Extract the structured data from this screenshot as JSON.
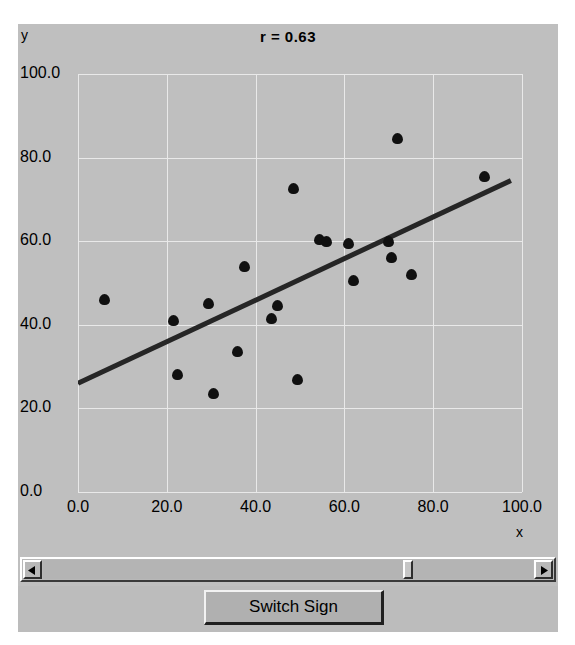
{
  "window": {
    "background_color": "#bfbfbf"
  },
  "chart_data": {
    "type": "scatter",
    "title": "r = 0.63",
    "xlabel": "x",
    "ylabel": "y",
    "xlim": [
      0.0,
      100.0
    ],
    "ylim": [
      0.0,
      100.0
    ],
    "xticks": [
      "0.0",
      "20.0",
      "40.0",
      "60.0",
      "80.0",
      "100.0"
    ],
    "xtick_values": [
      0,
      20,
      40,
      60,
      80,
      100
    ],
    "yticks": [
      "0.0",
      "20.0",
      "40.0",
      "60.0",
      "80.0",
      "100.0"
    ],
    "ytick_values": [
      0,
      20,
      40,
      60,
      80,
      100
    ],
    "grid": true,
    "legend": "none",
    "point_color": "#101010",
    "line_color": "#262626",
    "points": [
      {
        "x": 6.0,
        "y": 46.0
      },
      {
        "x": 21.5,
        "y": 41.0
      },
      {
        "x": 22.5,
        "y": 28.0
      },
      {
        "x": 29.5,
        "y": 45.0
      },
      {
        "x": 30.5,
        "y": 23.5
      },
      {
        "x": 36.0,
        "y": 33.5
      },
      {
        "x": 37.5,
        "y": 54.0
      },
      {
        "x": 43.5,
        "y": 41.5
      },
      {
        "x": 45.0,
        "y": 44.5
      },
      {
        "x": 48.5,
        "y": 72.5
      },
      {
        "x": 49.5,
        "y": 27.0
      },
      {
        "x": 54.5,
        "y": 60.5
      },
      {
        "x": 56.0,
        "y": 60.0
      },
      {
        "x": 61.0,
        "y": 59.5
      },
      {
        "x": 62.0,
        "y": 50.5
      },
      {
        "x": 70.0,
        "y": 60.0
      },
      {
        "x": 70.5,
        "y": 56.0
      },
      {
        "x": 72.0,
        "y": 84.5
      },
      {
        "x": 75.0,
        "y": 52.0
      },
      {
        "x": 91.5,
        "y": 75.5
      }
    ],
    "regression_line": {
      "x1": 0.0,
      "y1": 26.0,
      "x2": 97.5,
      "y2": 74.5
    }
  },
  "scrollbar": {
    "left_arrow_icon": "triangle-left-icon",
    "right_arrow_icon": "triangle-right-icon",
    "thumb_position_pct": 75
  },
  "controls": {
    "switch_sign_label": "Switch Sign"
  }
}
